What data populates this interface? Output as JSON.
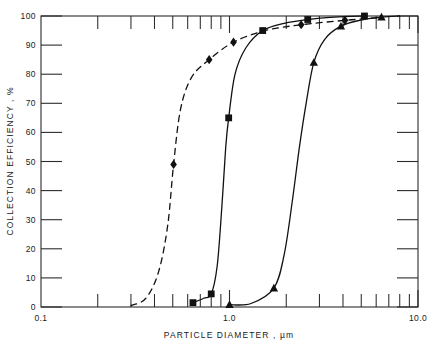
{
  "chart_data": {
    "type": "line",
    "title": "",
    "xlabel": "PARTICLE  DIAMETER , µm",
    "ylabel": "COLLECTION  EFFICIENCY , %",
    "xscale": "log",
    "yscale": "linear",
    "xlim": [
      0.1,
      10.0
    ],
    "ylim": [
      0,
      100
    ],
    "grid": false,
    "legend": "none",
    "x_tick_labels": [
      "0.1",
      "1.0",
      "10.0"
    ],
    "x_tick_values": [
      0.1,
      1.0,
      10.0
    ],
    "x_minor_ticks": [
      0.2,
      0.3,
      0.4,
      0.5,
      0.6,
      0.7,
      0.8,
      0.9,
      2.0,
      3.0,
      4.0,
      5.0,
      6.0,
      7.0,
      8.0,
      9.0
    ],
    "y_tick_labels": [
      "0",
      "10",
      "20",
      "30",
      "40",
      "50",
      "60",
      "70",
      "80",
      "90",
      "100"
    ],
    "y_tick_values": [
      0,
      10,
      20,
      30,
      40,
      50,
      60,
      70,
      80,
      90,
      100
    ],
    "series": [
      {
        "name": "curve-1",
        "marker": "diamond",
        "linestyle": "dashed",
        "points": [
          {
            "x": 0.3,
            "y": 0.5
          },
          {
            "x": 0.36,
            "y": 3
          },
          {
            "x": 0.42,
            "y": 12
          },
          {
            "x": 0.47,
            "y": 28
          },
          {
            "x": 0.505,
            "y": 49
          },
          {
            "x": 0.55,
            "y": 68
          },
          {
            "x": 0.63,
            "y": 79
          },
          {
            "x": 0.78,
            "y": 85
          },
          {
            "x": 1.05,
            "y": 91
          },
          {
            "x": 1.55,
            "y": 95
          },
          {
            "x": 2.4,
            "y": 97
          },
          {
            "x": 4.1,
            "y": 98.5
          },
          {
            "x": 6.4,
            "y": 99.5
          }
        ],
        "data_markers": [
          {
            "x": 0.505,
            "y": 49
          },
          {
            "x": 0.78,
            "y": 85
          },
          {
            "x": 1.05,
            "y": 91
          },
          {
            "x": 2.4,
            "y": 97
          },
          {
            "x": 4.1,
            "y": 98.5
          }
        ]
      },
      {
        "name": "curve-2",
        "marker": "square",
        "linestyle": "solid",
        "points": [
          {
            "x": 0.64,
            "y": 1.5
          },
          {
            "x": 0.73,
            "y": 3
          },
          {
            "x": 0.8,
            "y": 4.5
          },
          {
            "x": 0.86,
            "y": 14
          },
          {
            "x": 0.91,
            "y": 34
          },
          {
            "x": 0.955,
            "y": 55
          },
          {
            "x": 0.99,
            "y": 65
          },
          {
            "x": 1.07,
            "y": 80
          },
          {
            "x": 1.22,
            "y": 89
          },
          {
            "x": 1.5,
            "y": 95
          },
          {
            "x": 1.95,
            "y": 97.5
          },
          {
            "x": 2.6,
            "y": 98.8
          },
          {
            "x": 3.6,
            "y": 99.6
          },
          {
            "x": 5.2,
            "y": 100
          }
        ],
        "data_markers": [
          {
            "x": 0.64,
            "y": 1.5
          },
          {
            "x": 0.8,
            "y": 4.5
          },
          {
            "x": 0.99,
            "y": 65
          },
          {
            "x": 1.5,
            "y": 95
          },
          {
            "x": 2.6,
            "y": 98.8
          },
          {
            "x": 5.2,
            "y": 100
          }
        ]
      },
      {
        "name": "curve-3",
        "marker": "triangle",
        "linestyle": "solid",
        "points": [
          {
            "x": 1.0,
            "y": 0.8
          },
          {
            "x": 1.3,
            "y": 1.2
          },
          {
            "x": 1.72,
            "y": 6.5
          },
          {
            "x": 1.95,
            "y": 18
          },
          {
            "x": 2.15,
            "y": 36
          },
          {
            "x": 2.35,
            "y": 55
          },
          {
            "x": 2.55,
            "y": 70
          },
          {
            "x": 2.8,
            "y": 84
          },
          {
            "x": 3.2,
            "y": 92
          },
          {
            "x": 3.9,
            "y": 96.5
          },
          {
            "x": 4.9,
            "y": 98.5
          },
          {
            "x": 6.4,
            "y": 99.6
          },
          {
            "x": 8.0,
            "y": 100
          }
        ],
        "data_markers": [
          {
            "x": 1.0,
            "y": 0.8
          },
          {
            "x": 1.72,
            "y": 6.5
          },
          {
            "x": 2.8,
            "y": 84
          },
          {
            "x": 3.9,
            "y": 96.5
          },
          {
            "x": 6.4,
            "y": 99.6
          }
        ]
      }
    ]
  },
  "style": {
    "line_color": "#111111",
    "axis_color": "#2b2b2b",
    "background": "#ffffff"
  }
}
